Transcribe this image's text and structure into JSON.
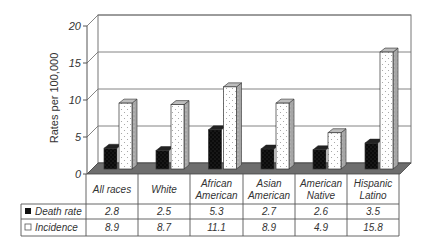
{
  "chart_data": {
    "type": "bar",
    "style": "3d-clustered-bar-with-data-table",
    "title": "",
    "xlabel": "",
    "ylabel": "Rates per 100,000",
    "ylim": [
      0,
      20
    ],
    "yticks": [
      0,
      5,
      10,
      15,
      20
    ],
    "grid": true,
    "legend_position": "in-data-table",
    "categories": [
      [
        "All races"
      ],
      [
        "White"
      ],
      [
        "African",
        "American"
      ],
      [
        "Asian",
        "American"
      ],
      [
        "American",
        "Native"
      ],
      [
        "Hispanic",
        "Latino"
      ]
    ],
    "series": [
      {
        "name": "Death rate",
        "pattern": "black-dotted",
        "color": "#111111",
        "values": [
          2.8,
          2.5,
          5.3,
          2.7,
          2.6,
          3.5
        ]
      },
      {
        "name": "Incidence",
        "pattern": "white-dotted",
        "color": "#ffffff",
        "values": [
          8.9,
          8.7,
          11.1,
          8.9,
          4.9,
          15.8
        ]
      }
    ],
    "table": {
      "rows": [
        {
          "label": "Death rate",
          "marker": "filled-square",
          "values": [
            "2.8",
            "2.5",
            "5.3",
            "2.7",
            "2.6",
            "3.5"
          ]
        },
        {
          "label": "Incidence",
          "marker": "empty-square",
          "values": [
            "8.9",
            "8.7",
            "11.1",
            "8.9",
            "4.9",
            "15.8"
          ]
        }
      ]
    }
  },
  "colors": {
    "axis": "#555555",
    "grid": "#777777",
    "floor": "#6e6e6e",
    "bar_side": "#9a9a9a",
    "bar_top": "#bdbdbd",
    "text": "#333333"
  }
}
